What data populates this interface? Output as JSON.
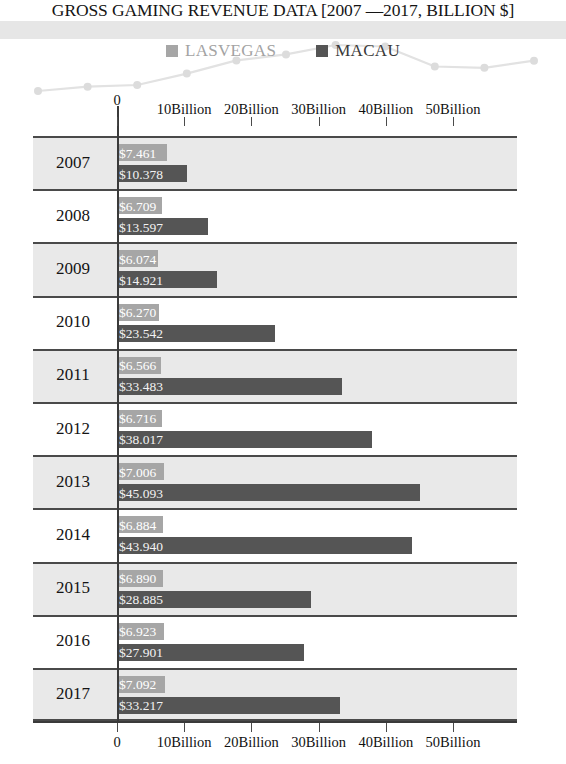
{
  "chart_data": {
    "type": "bar",
    "title": "GROSS GAMING REVENUE DATA [2007 —2017, BILLION $]",
    "orientation": "horizontal",
    "xlabel": "",
    "ylabel": "",
    "xlim": [
      0,
      55
    ],
    "grid": false,
    "legend_position": "top-center",
    "categories": [
      "2007",
      "2008",
      "2009",
      "2010",
      "2011",
      "2012",
      "2013",
      "2014",
      "2015",
      "2016",
      "2017"
    ],
    "series": [
      {
        "name": "LASVEGAS",
        "color": "#a6a6a6",
        "values": [
          7.461,
          6.709,
          6.074,
          6.27,
          6.566,
          6.716,
          7.006,
          6.884,
          6.89,
          6.923,
          7.092
        ],
        "labels": [
          "$7.461",
          "$6.709",
          "$6.074",
          "$6.270",
          "$6.566",
          "$6.716",
          "$7.006",
          "$6.884",
          "$6.890",
          "$6.923",
          "$7.092"
        ]
      },
      {
        "name": "MACAU",
        "color": "#555555",
        "values": [
          10.378,
          13.597,
          14.921,
          23.542,
          33.483,
          38.017,
          45.093,
          43.94,
          28.885,
          27.901,
          33.217
        ],
        "labels": [
          "$10.378",
          "$13.597",
          "$14.921",
          "$23.542",
          "$33.483",
          "$38.017",
          "$45.093",
          "$43.940",
          "$28.885",
          "$27.901",
          "$33.217"
        ]
      }
    ],
    "xticks": [
      {
        "value": 0,
        "label": "0"
      },
      {
        "value": 10,
        "label": "10Billion"
      },
      {
        "value": 20,
        "label": "20Billion"
      },
      {
        "value": 30,
        "label": "30Billion"
      },
      {
        "value": 40,
        "label": "40Billion"
      },
      {
        "value": 50,
        "label": "50Billion"
      }
    ]
  },
  "header": {
    "title": "GROSS GAMING REVENUE DATA [2007 —2017, BILLION $]"
  },
  "legend": {
    "items": [
      {
        "label": "LASVEGAS",
        "color": "#a6a6a6"
      },
      {
        "label": "MACAU",
        "color": "#555555"
      }
    ]
  },
  "axis": {
    "tick_labels": [
      "0",
      "10Billion",
      "20Billion",
      "30Billion",
      "40Billion",
      "50Billion"
    ]
  },
  "rows": [
    {
      "year": "2007",
      "lasvegas": "$7.461",
      "macau": "$10.378"
    },
    {
      "year": "2008",
      "lasvegas": "$6.709",
      "macau": "$13.597"
    },
    {
      "year": "2009",
      "lasvegas": "$6.074",
      "macau": "$14.921"
    },
    {
      "year": "2010",
      "lasvegas": "$6.270",
      "macau": "$23.542"
    },
    {
      "year": "2011",
      "lasvegas": "$6.566",
      "macau": "$33.483"
    },
    {
      "year": "2012",
      "lasvegas": "$6.716",
      "macau": "$38.017"
    },
    {
      "year": "2013",
      "lasvegas": "$7.006",
      "macau": "$45.093"
    },
    {
      "year": "2014",
      "lasvegas": "$6.884",
      "macau": "$43.940"
    },
    {
      "year": "2015",
      "lasvegas": "$6.890",
      "macau": "$28.885"
    },
    {
      "year": "2016",
      "lasvegas": "$6.923",
      "macau": "$27.901"
    },
    {
      "year": "2017",
      "lasvegas": "$7.092",
      "macau": "$33.217"
    }
  ]
}
